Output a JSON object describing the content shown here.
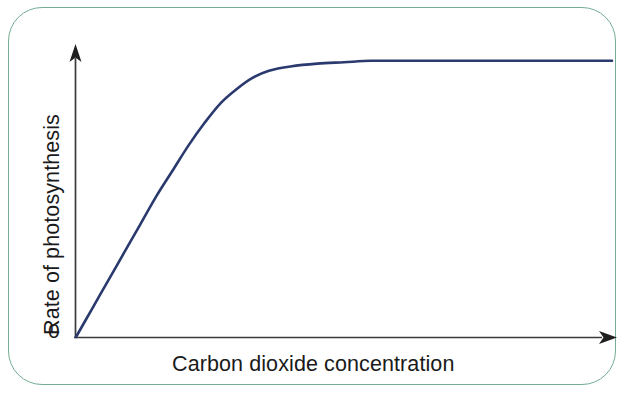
{
  "figure": {
    "background_color": "#ffffff",
    "border_color": "#74ad93",
    "curve_color": "#2a3a6e",
    "axis_color": "#3a3a3a"
  },
  "labels": {
    "ylabel": "Rate of photosynthesis",
    "xlabel": "Carbon dioxide concentration",
    "origin": "0"
  },
  "chart_data": {
    "type": "line",
    "title": "",
    "subtitle": "",
    "xlabel": "Carbon dioxide concentration",
    "ylabel": "Rate of photosynthesis",
    "grid": false,
    "legend": "none",
    "axis_style": "arrow-headed axes, no tick marks, no numeric scale",
    "tick_labels": {
      "x": [],
      "y": [
        "0"
      ]
    },
    "xlim": [
      0,
      100
    ],
    "ylim": [
      0,
      100
    ],
    "annotations": [],
    "series": [
      {
        "name": "Rate of photosynthesis vs CO2 concentration",
        "color": "#2a3a6e",
        "description": "Rises steeply and almost linearly from the origin, then bends over and levels off to a constant plateau (saturation / limiting factor curve).",
        "x": [
          0,
          3,
          6,
          9,
          12,
          15,
          18,
          21,
          24,
          27,
          30,
          33,
          36,
          40,
          45,
          50,
          55,
          60,
          70,
          80,
          90,
          100
        ],
        "y": [
          0,
          10,
          20,
          30,
          40,
          50,
          59,
          68,
          76,
          83,
          88,
          92,
          94.5,
          96,
          97,
          97.5,
          98,
          98,
          98,
          98,
          98,
          98
        ]
      }
    ]
  }
}
